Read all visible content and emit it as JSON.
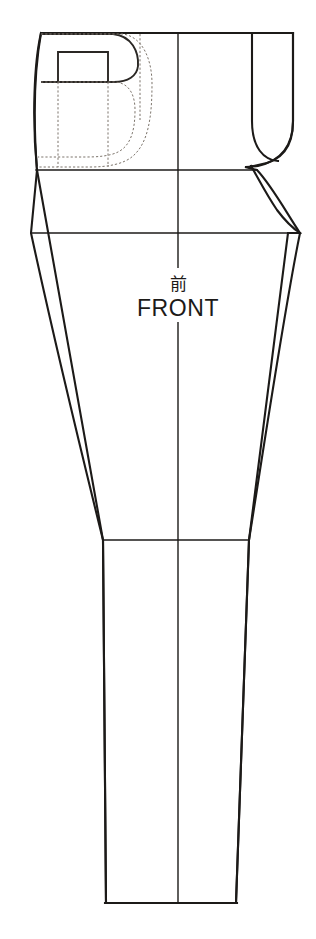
{
  "document": {
    "kind": "sewing-pattern-draft",
    "piece_name": "Trouser front leg",
    "background_color": "#ffffff",
    "ink_color": "#1c1a18",
    "dashed_ink_color": "#7d756c",
    "width_px": 316,
    "height_px": 939
  },
  "labels": {
    "piece_label_jp": "前",
    "piece_label_en": "FRONT"
  },
  "geometry": {
    "waist_line": {
      "x1": 41,
      "y1": 33,
      "x2": 293,
      "y2": 33
    },
    "hip_line": {
      "x1": 37,
      "y1": 170,
      "x2": 257,
      "y2": 170
    },
    "crotch_line": {
      "x1": 31,
      "y1": 233,
      "x2": 300,
      "y2": 233
    },
    "knee_line": {
      "x1": 103,
      "y1": 540,
      "x2": 249,
      "y2": 540
    },
    "hem_line": {
      "x1": 106,
      "y1": 903,
      "x2": 236,
      "y2": 903
    },
    "grainline_top": {
      "x": 178,
      "y": 33
    },
    "grainline_bottom": {
      "x": 178,
      "y": 903
    },
    "side_seam_path": "left outer edge from waist through hip and knee to hem",
    "inseam_path": "right inner edge from crotch point through knee to hem",
    "crotch_curve": "J-shaped fly / crotch curve at upper right",
    "pocket_opening_rect": {
      "x": 58,
      "y": 52,
      "w": 50,
      "h": 30
    },
    "pocket_bag_dashed": "rounded pocket bag outline below the pocket opening"
  },
  "icons": {
    "grainline": "grainline-arrow-icon"
  }
}
